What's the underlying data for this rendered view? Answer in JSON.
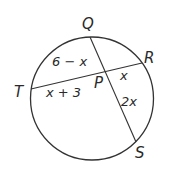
{
  "diagram": {
    "type": "circle-intersecting-chords",
    "circle": {
      "cx": 92,
      "cy": 98,
      "r": 61,
      "stroke": "#333333"
    },
    "points": {
      "Q": {
        "label": "Q",
        "x": 90,
        "y": 37
      },
      "R": {
        "label": "R",
        "x": 142,
        "y": 64
      },
      "S": {
        "label": "S",
        "x": 136,
        "y": 142
      },
      "T": {
        "label": "T",
        "x": 31,
        "y": 89
      },
      "P": {
        "label": "P",
        "x": 105,
        "y": 73
      }
    },
    "chords": [
      {
        "name": "QS",
        "from": "Q",
        "to": "S"
      },
      {
        "name": "TR",
        "from": "T",
        "to": "R"
      }
    ],
    "segment_labels": {
      "QP": "6 − x",
      "TP": "x + 3",
      "PR": "x",
      "PS": "2x"
    }
  }
}
